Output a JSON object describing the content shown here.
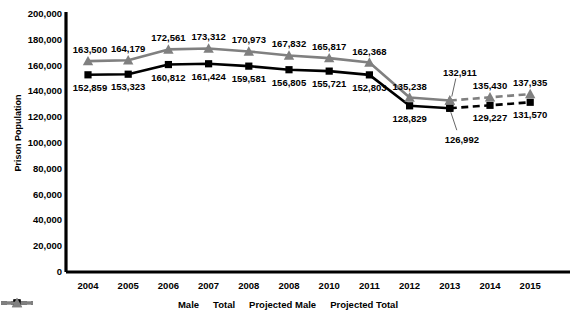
{
  "chart_data": {
    "type": "line",
    "title": "",
    "xlabel": "",
    "ylabel": "Prison Population",
    "categories": [
      "2004",
      "2005",
      "2006",
      "2007",
      "2008",
      "2008",
      "2010",
      "2011",
      "2012",
      "2013",
      "2014",
      "2015"
    ],
    "ylim": [
      0,
      200000
    ],
    "ytick_step": 20000,
    "ytick_labels": [
      "200,000",
      "180,000",
      "160,000",
      "140,000",
      "120,000",
      "100,000",
      "80,000",
      "60,000",
      "40,000",
      "20,000",
      "0"
    ],
    "ytick_values": [
      200000,
      180000,
      160000,
      140000,
      120000,
      100000,
      80000,
      60000,
      40000,
      20000,
      0
    ],
    "grid": false,
    "legend_position": "bottom",
    "projection_starts_after_index": 9,
    "series": [
      {
        "name": "Male",
        "color": "#000000",
        "marker": "square",
        "style": "solid",
        "values": [
          152859,
          153323,
          160812,
          161424,
          159581,
          156805,
          155721,
          152803,
          128829,
          126992,
          null,
          null
        ],
        "labels": [
          "152,859",
          "153,323",
          "160,812",
          "161,424",
          "159,581",
          "156,805",
          "155,721",
          "152,803",
          "128,829",
          "126,992",
          "",
          ""
        ]
      },
      {
        "name": "Total",
        "color": "#808080",
        "marker": "triangle",
        "style": "solid",
        "values": [
          163500,
          164179,
          172561,
          173312,
          170973,
          167832,
          165817,
          162368,
          135238,
          132911,
          null,
          null
        ],
        "labels": [
          "163,500",
          "164,179",
          "172,561",
          "173,312",
          "170,973",
          "167,832",
          "165,817",
          "162,368",
          "135,238",
          "132,911",
          "",
          ""
        ]
      },
      {
        "name": "Projected Male",
        "color": "#000000",
        "marker": "square",
        "style": "dashed",
        "values": [
          null,
          null,
          null,
          null,
          null,
          null,
          null,
          null,
          null,
          126992,
          129227,
          131570
        ],
        "labels": [
          "",
          "",
          "",
          "",
          "",
          "",
          "",
          "",
          "",
          "",
          "129,227",
          "131,570"
        ]
      },
      {
        "name": "Projected Total",
        "color": "#808080",
        "marker": "triangle",
        "style": "dashed",
        "values": [
          null,
          null,
          null,
          null,
          null,
          null,
          null,
          null,
          null,
          132911,
          135430,
          137935
        ],
        "labels": [
          "",
          "",
          "",
          "",
          "",
          "",
          "",
          "",
          "",
          "",
          "135,430",
          "137,935"
        ]
      }
    ],
    "legend": [
      {
        "label": "Male",
        "color": "#000000",
        "marker": "square",
        "style": "solid"
      },
      {
        "label": "Total",
        "color": "#808080",
        "marker": "triangle",
        "style": "solid"
      },
      {
        "label": "Projected Male",
        "color": "#000000",
        "marker": "square",
        "style": "dashed"
      },
      {
        "label": "Projected Total",
        "color": "#808080",
        "marker": "triangle",
        "style": "dashed"
      }
    ]
  }
}
